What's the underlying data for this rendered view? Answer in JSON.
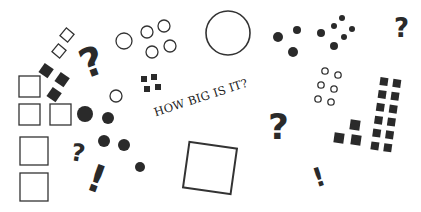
{
  "caption": "HOW BIG IS IT?",
  "symbols": {
    "question": "?",
    "exclamation": "!"
  },
  "colors": {
    "ink": "#2a2a2a",
    "background": "#ffffff"
  }
}
